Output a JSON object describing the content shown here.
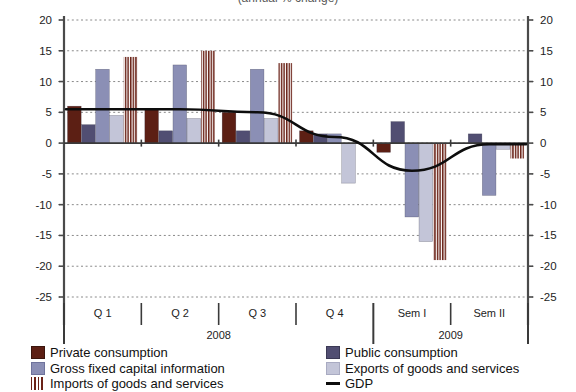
{
  "chart_title_partial": "(annual % change)",
  "axis": {
    "y_ticks": [
      "20",
      "15",
      "10",
      "5",
      "0",
      "-5",
      "-10",
      "-15",
      "-20",
      "-25"
    ],
    "y_values": [
      20,
      15,
      10,
      5,
      0,
      -5,
      -10,
      -15,
      -20,
      -25
    ],
    "y_min": -25,
    "y_max": 20
  },
  "categories": [
    "Q 1",
    "Q 2",
    "Q 3",
    "Q 4",
    "Sem I",
    "Sem II"
  ],
  "year_groups": [
    {
      "label": "2008",
      "span": 4
    },
    {
      "label": "2009",
      "span": 2
    }
  ],
  "legend": {
    "left": [
      {
        "key": "private",
        "label": "Private consumption"
      },
      {
        "key": "gfcf",
        "label": "Gross fixed capital information"
      },
      {
        "key": "imports",
        "label": "Imports of goods and services"
      }
    ],
    "right": [
      {
        "key": "public",
        "label": "Public consumption"
      },
      {
        "key": "exports",
        "label": "Exports of goods and services"
      },
      {
        "key": "gdp",
        "label": "GDP"
      }
    ]
  },
  "colors": {
    "private": "#5c1f14",
    "public": "#514e72",
    "gfcf": "#8b8fb5",
    "exports": "#c3c5d8",
    "imports_stripe": "#6b2318",
    "gdp": "#0d0d0d",
    "axis": "#555555",
    "grid": "#8a8a8a",
    "background": "#ffffff"
  },
  "chart_data": {
    "type": "bar",
    "title": "(annual % change)",
    "xlabel": "",
    "ylabel": "",
    "ylim": [
      -25,
      20
    ],
    "grid": true,
    "legend_position": "bottom",
    "categories": [
      "Q 1",
      "Q 2",
      "Q 3",
      "Q 4",
      "Sem I",
      "Sem II"
    ],
    "series": [
      {
        "name": "Private consumption",
        "values": [
          6.0,
          5.5,
          5.0,
          2.0,
          -1.5,
          0.0
        ]
      },
      {
        "name": "Public consumption",
        "values": [
          3.0,
          2.0,
          2.0,
          1.5,
          3.5,
          1.5
        ]
      },
      {
        "name": "Gross fixed capital information",
        "values": [
          12.0,
          12.7,
          12.0,
          1.5,
          -12.0,
          -8.5
        ]
      },
      {
        "name": "Exports of goods and services",
        "values": [
          4.5,
          4.0,
          4.0,
          -6.5,
          -16.0,
          -1.0
        ]
      },
      {
        "name": "Imports of goods and services",
        "values": [
          14.0,
          15.0,
          13.0,
          0.0,
          -19.0,
          -2.5
        ]
      }
    ],
    "line_series": [
      {
        "name": "GDP",
        "x": [
          "Q 1",
          "Q 2",
          "Q 3",
          "Q 4",
          "Sem I",
          "Sem II"
        ],
        "values": [
          5.5,
          5.5,
          5.0,
          1.0,
          -4.5,
          -0.2
        ]
      }
    ]
  }
}
